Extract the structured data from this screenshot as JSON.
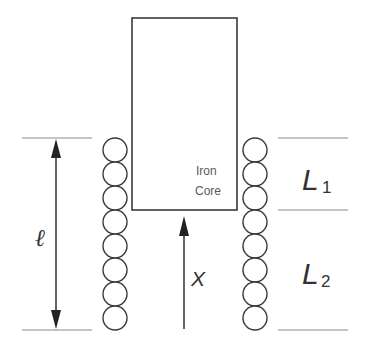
{
  "diagram": {
    "type": "iron-core-inductor-cross-section",
    "core": {
      "label_line1": "Iron",
      "label_line2": "Core"
    },
    "coil": {
      "turns_per_side": 8
    },
    "labels": {
      "length": "ℓ",
      "displacement": "X",
      "inductance_1_main": "L",
      "inductance_1_sub": "1",
      "inductance_2_main": "L",
      "inductance_2_sub": "2"
    },
    "colors": {
      "stroke": "#3a3a3a",
      "dimension_line": "#8a8a8a",
      "text": "#333333",
      "background": "#ffffff"
    }
  }
}
